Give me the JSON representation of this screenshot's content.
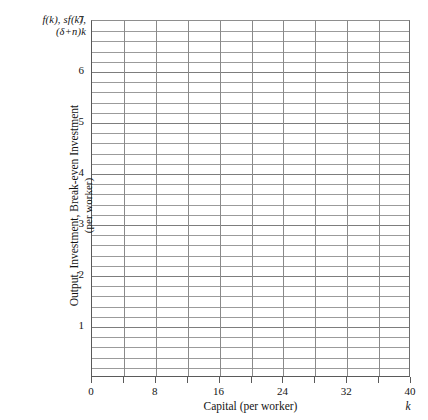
{
  "chart_data": {
    "type": "line",
    "title": "",
    "subtitle": "",
    "xlabel": "Capital (per worker)",
    "x_variable_symbol": "k",
    "ylabel_line1": "Output, Investment, Break-even Investment",
    "ylabel_line2": "(per worker)",
    "y_axis_annotation": {
      "line1": "f(k), sf(k),",
      "line2": "(δ+n)k"
    },
    "xlim": [
      0,
      40
    ],
    "ylim": [
      0,
      7
    ],
    "x_tick_labels": [
      "0",
      "8",
      "16",
      "24",
      "32",
      "40"
    ],
    "x_tick_values": [
      0,
      8,
      16,
      24,
      32,
      40
    ],
    "x_gridline_values": [
      4,
      8,
      12,
      16,
      20,
      24,
      28,
      32,
      36
    ],
    "x_tick_mark_values": [
      0,
      4,
      8,
      12,
      16,
      20,
      24,
      28,
      32,
      36,
      40
    ],
    "y_tick_labels": [
      "1",
      "2",
      "3",
      "4",
      "5",
      "6",
      "7"
    ],
    "y_tick_values": [
      1,
      2,
      3,
      4,
      5,
      6,
      7
    ],
    "y_minor_step": 0.2,
    "grid": true,
    "legend": "none",
    "series": [],
    "values": [],
    "categories": [],
    "annotations": [],
    "note": "Empty plotting grid; no data series are drawn on the axes."
  },
  "colors": {
    "background": "#ffffff",
    "gridline_horizontal": "#9b9b9b",
    "gridline_vertical": "#8a8a8a",
    "axis_spine": "#5a5a5a",
    "text": "#141414"
  }
}
